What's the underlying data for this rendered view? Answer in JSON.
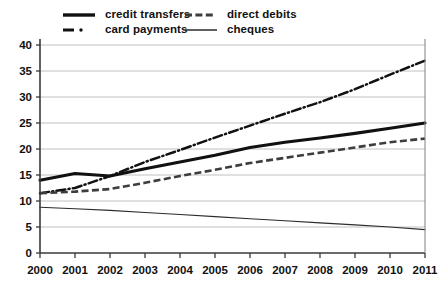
{
  "legend": {
    "items": [
      {
        "key": "credit_transfers",
        "label": "credit transfers",
        "style": "solid-thick"
      },
      {
        "key": "card_payments",
        "label": "card payments",
        "style": "dash-dot"
      },
      {
        "key": "direct_debits",
        "label": "direct debits",
        "style": "dashed"
      },
      {
        "key": "cheques",
        "label": "cheques",
        "style": "solid-thin"
      }
    ]
  },
  "axis": {
    "y_ticks": [
      "0",
      "5",
      "10",
      "15",
      "20",
      "25",
      "30",
      "35",
      "40"
    ],
    "x_ticks": [
      "2000",
      "2001",
      "2002",
      "2003",
      "2004",
      "2005",
      "2006",
      "2007",
      "2008",
      "2009",
      "2010",
      "2011"
    ]
  },
  "colors": {
    "credit_transfers": "#111111",
    "card_payments": "#111111",
    "direct_debits": "#3d3d3d",
    "cheques": "#2b2b2b",
    "gridline": "#b9b9b9",
    "axis": "#3a3a3a",
    "background": "#ffffff"
  },
  "chart_data": {
    "type": "line",
    "title": "",
    "subtitle": "",
    "xlabel": "",
    "ylabel": "",
    "x": [
      2000,
      2001,
      2002,
      2003,
      2004,
      2005,
      2006,
      2007,
      2008,
      2009,
      2010,
      2011
    ],
    "categories": [
      "2000",
      "2001",
      "2002",
      "2003",
      "2004",
      "2005",
      "2006",
      "2007",
      "2008",
      "2009",
      "2010",
      "2011"
    ],
    "xlim": [
      2000,
      2011
    ],
    "ylim": [
      0,
      40
    ],
    "y_tick_step": 5,
    "grid": true,
    "legend_position": "top",
    "series": [
      {
        "name": "credit transfers",
        "linestyle": "solid-thick",
        "values": [
          14.0,
          15.3,
          14.8,
          16.2,
          17.5,
          18.8,
          20.3,
          21.3,
          22.1,
          23.0,
          24.0,
          25.0
        ]
      },
      {
        "name": "card payments",
        "linestyle": "dash-dot",
        "values": [
          11.5,
          12.5,
          14.8,
          17.5,
          19.8,
          22.2,
          24.5,
          26.8,
          29.0,
          31.5,
          34.3,
          37.0
        ]
      },
      {
        "name": "direct debits",
        "linestyle": "dashed",
        "values": [
          11.5,
          11.8,
          12.3,
          13.5,
          14.8,
          16.0,
          17.3,
          18.3,
          19.3,
          20.3,
          21.3,
          22.0
        ]
      },
      {
        "name": "cheques",
        "linestyle": "solid-thin",
        "values": [
          8.8,
          8.5,
          8.2,
          7.8,
          7.4,
          7.0,
          6.6,
          6.2,
          5.8,
          5.4,
          5.0,
          4.5
        ]
      }
    ]
  }
}
